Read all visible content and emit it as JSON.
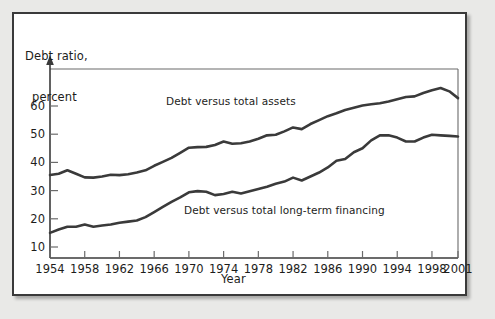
{
  "figure": {
    "background_color": "#e9e9e7",
    "panel_color": "#ffffff",
    "border_color": "#3a3a3a",
    "line_color": "#3a3a3a",
    "axis_color": "#6b6b6b"
  },
  "chart_data": {
    "type": "line",
    "title": "",
    "subtitle": "",
    "ylabel": "Debt ratio,\n percent",
    "ylabel_line1": "Debt ratio,",
    "ylabel_line2": "percent",
    "xlabel": "Year",
    "xlim": [
      1954,
      2001
    ],
    "ylim": [
      0,
      70
    ],
    "yticks": [
      10,
      20,
      30,
      40,
      50,
      60
    ],
    "ytick_labels": [
      "10",
      "20",
      "30",
      "40",
      "50",
      "60"
    ],
    "xticks": [
      1954,
      1958,
      1962,
      1966,
      1970,
      1974,
      1978,
      1982,
      1986,
      1990,
      1994,
      1998,
      2001
    ],
    "xtick_labels": [
      "1954",
      "1958",
      "1962",
      "1966",
      "1970",
      "1974",
      "1978",
      "1982",
      "1986",
      "1990",
      "1994",
      "1998",
      "2001"
    ],
    "grid": false,
    "legend_position": "inline-annotation",
    "annotations": [
      {
        "text": "Debt versus total assets",
        "x": 1972,
        "y": 56
      },
      {
        "text": "Debt versus total long-term financing",
        "x": 1976,
        "y": 22
      }
    ],
    "x": [
      1954,
      1955,
      1956,
      1957,
      1958,
      1959,
      1960,
      1961,
      1962,
      1963,
      1964,
      1965,
      1966,
      1967,
      1968,
      1969,
      1970,
      1971,
      1972,
      1973,
      1974,
      1975,
      1976,
      1977,
      1978,
      1979,
      1980,
      1981,
      1982,
      1983,
      1984,
      1985,
      1986,
      1987,
      1988,
      1989,
      1990,
      1991,
      1992,
      1993,
      1994,
      1995,
      1996,
      1997,
      1998,
      1999,
      2000,
      2001
    ],
    "series": [
      {
        "name": "Debt versus total assets",
        "values": [
          35.5,
          36.0,
          37.2,
          36.0,
          34.7,
          34.6,
          35.0,
          35.6,
          35.5,
          35.8,
          36.4,
          37.2,
          38.8,
          40.2,
          41.6,
          43.4,
          45.2,
          45.4,
          45.5,
          46.2,
          47.4,
          46.6,
          46.8,
          47.4,
          48.4,
          49.6,
          49.8,
          51.0,
          52.4,
          51.8,
          53.6,
          55.0,
          56.4,
          57.4,
          58.6,
          59.4,
          60.2,
          60.6,
          61.0,
          61.6,
          62.4,
          63.2,
          63.4,
          64.6,
          65.6,
          66.4,
          65.2,
          62.8
        ]
      },
      {
        "name": "Debt versus total long-term financing",
        "values": [
          15.0,
          16.2,
          17.2,
          17.2,
          18.0,
          17.2,
          17.6,
          18.0,
          18.6,
          19.0,
          19.4,
          20.6,
          22.4,
          24.2,
          26.0,
          27.6,
          29.4,
          29.8,
          29.6,
          28.4,
          28.8,
          29.6,
          29.0,
          29.8,
          30.6,
          31.4,
          32.4,
          33.2,
          34.6,
          33.6,
          35.0,
          36.4,
          38.2,
          40.6,
          41.2,
          43.6,
          45.0,
          47.8,
          49.6,
          49.6,
          48.8,
          47.4,
          47.4,
          48.8,
          49.8,
          49.6,
          49.4,
          49.2
        ]
      }
    ]
  }
}
